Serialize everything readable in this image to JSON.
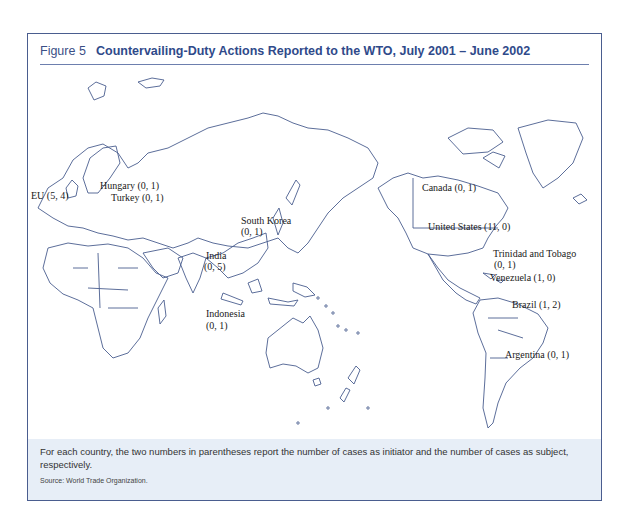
{
  "figure": {
    "number": "Figure 5",
    "title": "Countervailing-Duty Actions Reported to the WTO, July 2001 – June 2002"
  },
  "map": {
    "type": "world-outline",
    "line_color": "#4a5d8f",
    "labels": [
      {
        "country": "EU",
        "text": "EU (5, 4)",
        "initiator": 5,
        "subject": 4
      },
      {
        "country": "Hungary",
        "text": "Hungary (0, 1)",
        "initiator": 0,
        "subject": 1
      },
      {
        "country": "Turkey",
        "text": "Turkey (0, 1)",
        "initiator": 0,
        "subject": 1
      },
      {
        "country": "South Korea",
        "text_line1": "South Korea",
        "text_line2": "(0, 1)",
        "initiator": 0,
        "subject": 1
      },
      {
        "country": "India",
        "text_line1": "India",
        "text_line2": "(0, 5)",
        "initiator": 0,
        "subject": 5
      },
      {
        "country": "Indonesia",
        "text_line1": "Indonesia",
        "text_line2": "(0, 1)",
        "initiator": 0,
        "subject": 1
      },
      {
        "country": "Canada",
        "text": "Canada (0, 1)",
        "initiator": 0,
        "subject": 1
      },
      {
        "country": "United States",
        "text": "United States (11, 0)",
        "initiator": 11,
        "subject": 0
      },
      {
        "country": "Trinidad and Tobago",
        "text_line1": "Trinidad and Tobago",
        "text_line2": "(0, 1)",
        "initiator": 0,
        "subject": 1
      },
      {
        "country": "Venezuela",
        "text": "Venezuela (1, 0)",
        "initiator": 1,
        "subject": 0
      },
      {
        "country": "Brazil",
        "text": "Brazil (1, 2)",
        "initiator": 1,
        "subject": 2
      },
      {
        "country": "Argentina",
        "text": "Argentina (0, 1)",
        "initiator": 0,
        "subject": 1
      }
    ]
  },
  "caption": {
    "note": "For each country, the two numbers in parentheses report the number of cases as initiator and the number of cases as subject, respectively.",
    "source": "Source: World Trade Organization."
  },
  "colors": {
    "frame": "#4a5d8f",
    "title": "#2f4a8a",
    "caption_bg": "#e7eef7"
  }
}
